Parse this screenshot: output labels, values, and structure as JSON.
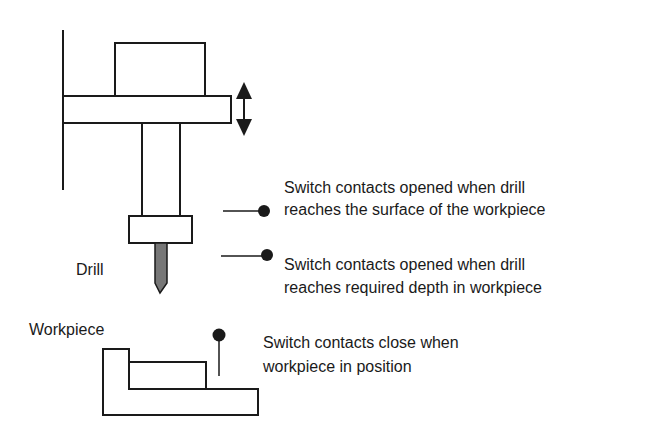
{
  "labels": {
    "drill": "Drill",
    "workpiece": "Workpiece"
  },
  "switches": [
    {
      "line1": "Switch contacts opened when drill",
      "line2": "reaches the surface of the workpiece"
    },
    {
      "line1": "Switch contacts opened when drill",
      "line2": "reaches required depth in workpiece"
    },
    {
      "line1": "Switch contacts close when",
      "line2": "workpiece in position"
    }
  ],
  "icons": {
    "motion_arrow": "double-headed-vertical-arrow"
  },
  "colors": {
    "stroke": "#1a1a1a",
    "drill_bit": "#777777",
    "background": "#ffffff"
  }
}
